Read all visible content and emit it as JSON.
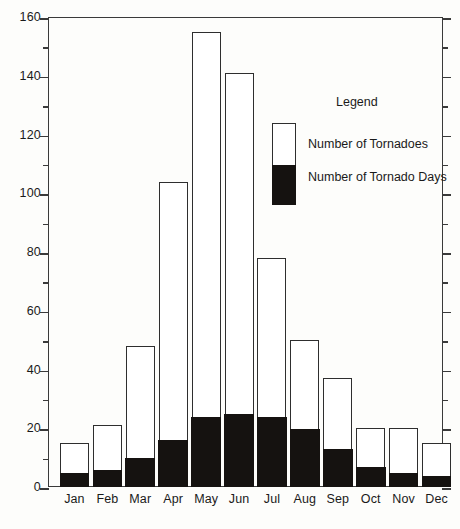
{
  "chart_data": {
    "type": "bar",
    "subtype": "stacked-bar",
    "title": "",
    "xlabel": "",
    "ylabel": "",
    "ylim": [
      0,
      160
    ],
    "y_major_step": 20,
    "y_minor_step": 10,
    "y_ticks": [
      0,
      20,
      40,
      60,
      80,
      100,
      120,
      140,
      160
    ],
    "y_tick_labels": [
      "0",
      "20",
      "40",
      "60",
      "80",
      "100",
      "120",
      "140",
      "160"
    ],
    "y_minor_ticks": [
      10,
      30,
      50,
      70,
      90,
      110,
      130,
      150
    ],
    "grid": false,
    "categories": [
      "Jan",
      "Feb",
      "Mar",
      "Apr",
      "May",
      "Jun",
      "Jul",
      "Aug",
      "Sep",
      "Oct",
      "Nov",
      "Dec"
    ],
    "series": [
      {
        "name": "Number of Tornadoes",
        "color": "#ffffff",
        "values": [
          15,
          21,
          48,
          104,
          155,
          141,
          78,
          50,
          37,
          20,
          20,
          15
        ]
      },
      {
        "name": "Number of Tornado Days",
        "color": "#151210",
        "values": [
          5,
          6,
          10,
          16,
          24,
          25,
          24,
          20,
          13,
          7,
          5,
          4
        ]
      }
    ],
    "legend": {
      "position": "inside-upper-right",
      "title": "Legend",
      "entries": [
        {
          "label": "Number of Tornadoes",
          "color": "#ffffff"
        },
        {
          "label": "Number of Tornado Days",
          "color": "#151210"
        }
      ]
    },
    "axis_color": "#3a3a3a",
    "bar_outline_color": "#2e2e2e",
    "background_color": "#fdfdfb"
  }
}
